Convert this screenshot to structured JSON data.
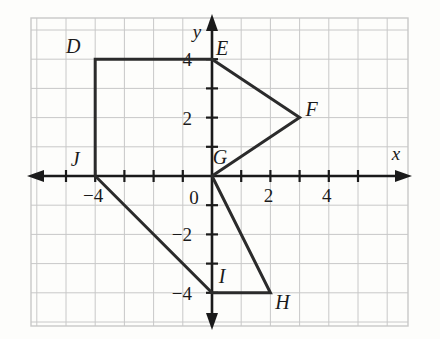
{
  "figure": {
    "kind": "coordinate-plane-polygon",
    "axes": {
      "x_axis_label": "x",
      "y_axis_label": "y",
      "origin_label": "0",
      "x_tick_labels": [
        {
          "value": -4,
          "text": "−4"
        },
        {
          "value": 2,
          "text": "2"
        },
        {
          "value": 4,
          "text": "4"
        }
      ],
      "y_tick_labels": [
        {
          "value": 4,
          "text": "4"
        },
        {
          "value": 2,
          "text": "2"
        },
        {
          "value": -2,
          "text": "−2"
        },
        {
          "value": -4,
          "text": "−4"
        }
      ],
      "x_range": [
        -6,
        6
      ],
      "y_range": [
        -5,
        5
      ],
      "grid": true,
      "grid_color": "#c8c8c8",
      "axis_color": "#1a1a1a",
      "shape_color": "#2b2b2b"
    },
    "points": [
      {
        "name": "D",
        "x": -4,
        "y": 4,
        "label_dx": -22,
        "label_dy": -6
      },
      {
        "name": "E",
        "x": 0,
        "y": 4,
        "label_dx": 10,
        "label_dy": -4
      },
      {
        "name": "F",
        "x": 3,
        "y": 2,
        "label_dx": 12,
        "label_dy": -2
      },
      {
        "name": "G",
        "x": 0,
        "y": 0,
        "label_dx": 8,
        "label_dy": -12
      },
      {
        "name": "H",
        "x": 2,
        "y": -4,
        "label_dx": 12,
        "label_dy": 16
      },
      {
        "name": "I",
        "x": 0,
        "y": -4,
        "label_dx": 10,
        "label_dy": -10
      },
      {
        "name": "J",
        "x": -4,
        "y": 0,
        "label_dx": -20,
        "label_dy": -10
      }
    ],
    "polygon_order": [
      "D",
      "E",
      "F",
      "G",
      "H",
      "I",
      "J"
    ]
  },
  "chart_data": {
    "type": "scatter",
    "title": "",
    "xlabel": "x",
    "ylabel": "y",
    "xlim": [
      -6,
      6
    ],
    "ylim": [
      -5,
      5
    ],
    "grid": true,
    "x": [
      -4,
      0,
      3,
      0,
      2,
      0,
      -4
    ],
    "y": [
      4,
      4,
      2,
      0,
      -4,
      -4,
      0
    ],
    "labels": [
      "D",
      "E",
      "F",
      "G",
      "H",
      "I",
      "J"
    ],
    "annotations": [
      "D(-4, 4)",
      "E(0, 4)",
      "F(3, 2)",
      "G(0, 0)",
      "H(2, -4)",
      "I(0, -4)",
      "J(-4, 0)"
    ]
  }
}
